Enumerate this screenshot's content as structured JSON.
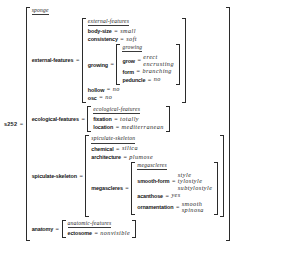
{
  "root": {
    "tag": "s252",
    "eq": "=",
    "type": "sponge"
  },
  "symbols": {
    "equals": "="
  },
  "features": {
    "external_features": {
      "attr": "external-features",
      "type": "external-features",
      "body_size": {
        "attr": "body-size",
        "value": "small"
      },
      "consistency": {
        "attr": "consistency",
        "value": "soft"
      },
      "growing": {
        "attr": "growing",
        "type": "growing",
        "grow": {
          "attr": "grow",
          "values": [
            "erect",
            "encrusting"
          ]
        },
        "form": {
          "attr": "form",
          "value": "branching"
        },
        "peduncle": {
          "attr": "peduncle",
          "value": "no"
        }
      },
      "hollow": {
        "attr": "hollow",
        "value": "no"
      },
      "osc": {
        "attr": "osc",
        "value": "no"
      }
    },
    "ecological_features": {
      "attr": "ecological-features",
      "type": "ecological-features",
      "fixation": {
        "attr": "fixation",
        "value": "totally"
      },
      "location": {
        "attr": "location",
        "value": "mediterranean"
      }
    },
    "spiculate_skeleton": {
      "attr": "spiculate-skeleton",
      "type": "spiculate-skeleton",
      "chemical": {
        "attr": "chemical",
        "value": "silica"
      },
      "architecture": {
        "attr": "architecture",
        "value": "plumose"
      },
      "megascleres": {
        "attr": "megascleres",
        "type": "megascleres",
        "smooth_form": {
          "attr": "smooth-form",
          "values": [
            "style",
            "tylostyle",
            "subtylostyle"
          ]
        },
        "acanthose": {
          "attr": "acanthose",
          "value": "yes"
        },
        "ornamentation": {
          "attr": "ornamentation",
          "values": [
            "smooth",
            "spinosa"
          ]
        }
      }
    },
    "anatomy": {
      "attr": "anatomy",
      "type": "anatomic-features",
      "ectosome": {
        "attr": "ectosome",
        "value": "nonvisible"
      }
    }
  },
  "colors": {
    "ink": "#1a1a1a",
    "bracket": "#2b2b2b",
    "background": "#ffffff"
  }
}
